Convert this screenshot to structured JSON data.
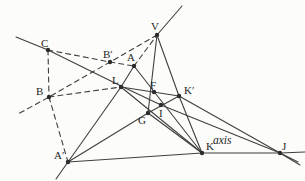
{
  "figure": {
    "type": "geometry-diagram",
    "canvas": {
      "width": 305,
      "height": 181
    },
    "colors": {
      "background": "#fcfcfa",
      "stroke": "#3f3f3f",
      "dot": "#2c2c2c",
      "label": "#262626"
    },
    "axis_label": {
      "text": "axis",
      "x": 213,
      "y": 144,
      "font_size": 11.5
    },
    "points": [
      {
        "id": "V",
        "label": "V",
        "x": 157,
        "y": 35,
        "lx": 151,
        "ly": 30
      },
      {
        "id": "C",
        "label": "C",
        "x": 48,
        "y": 50,
        "lx": 41,
        "ly": 47
      },
      {
        "id": "Bp",
        "label": "B′",
        "x": 110,
        "y": 62,
        "lx": 103,
        "ly": 58
      },
      {
        "id": "A",
        "label": "A",
        "x": 134,
        "y": 66,
        "lx": 127,
        "ly": 61
      },
      {
        "id": "L",
        "label": "L",
        "x": 121,
        "y": 87,
        "lx": 112,
        "ly": 84
      },
      {
        "id": "F",
        "label": "F",
        "x": 154,
        "y": 92,
        "lx": 150,
        "ly": 89
      },
      {
        "id": "Kp",
        "label": "K′",
        "x": 179,
        "y": 96,
        "lx": 184,
        "ly": 94
      },
      {
        "id": "B",
        "label": "B",
        "x": 49,
        "y": 97,
        "lx": 36,
        "ly": 95
      },
      {
        "id": "I",
        "label": "I",
        "x": 161,
        "y": 105,
        "lx": 159,
        "ly": 117
      },
      {
        "id": "G",
        "label": "G",
        "x": 148,
        "y": 113,
        "lx": 138,
        "ly": 124
      },
      {
        "id": "Ap",
        "label": "A′",
        "x": 68,
        "y": 162,
        "lx": 54,
        "ly": 159
      },
      {
        "id": "K",
        "label": "K",
        "x": 202,
        "y": 153,
        "lx": 206,
        "ly": 150
      },
      {
        "id": "J",
        "label": "J",
        "x": 280,
        "y": 153,
        "lx": 282,
        "ly": 150
      }
    ],
    "solid_lines": [
      {
        "name": "line-C-L-I-J",
        "points": [
          [
            16,
            37
          ],
          [
            48,
            50
          ],
          [
            121,
            86
          ],
          [
            161,
            105
          ],
          [
            280,
            153
          ],
          [
            298,
            162
          ]
        ]
      },
      {
        "name": "line-V-top-extension",
        "points": [
          [
            157,
            35
          ],
          [
            182,
            6
          ]
        ]
      },
      {
        "name": "line-A-L-Aprime",
        "points": [
          [
            134,
            66
          ],
          [
            121,
            87
          ],
          [
            68,
            162
          ],
          [
            56,
            179
          ]
        ]
      },
      {
        "name": "line-V-Kprime-K",
        "points": [
          [
            157,
            35
          ],
          [
            179,
            96
          ],
          [
            202,
            153
          ]
        ]
      },
      {
        "name": "line-V-F-G",
        "points": [
          [
            157,
            35
          ],
          [
            148,
            113
          ]
        ]
      },
      {
        "name": "line-L-Kprime",
        "points": [
          [
            121,
            87
          ],
          [
            179,
            96
          ]
        ]
      },
      {
        "name": "line-L-K",
        "points": [
          [
            121,
            87
          ],
          [
            202,
            153
          ]
        ]
      },
      {
        "name": "line-A-F-I-K",
        "points": [
          [
            134,
            66
          ],
          [
            202,
            153
          ]
        ]
      },
      {
        "name": "line-Aprime-G-Kprime",
        "points": [
          [
            68,
            162
          ],
          [
            148,
            113
          ],
          [
            179,
            96
          ]
        ]
      },
      {
        "name": "line-Kprime-J",
        "points": [
          [
            179,
            96
          ],
          [
            280,
            153
          ],
          [
            300,
            165
          ]
        ]
      },
      {
        "name": "line-axis",
        "points": [
          [
            68,
            162
          ],
          [
            202,
            153
          ],
          [
            280,
            153
          ],
          [
            305,
            152
          ]
        ]
      },
      {
        "name": "line-G-K",
        "points": [
          [
            148,
            113
          ],
          [
            202,
            153
          ]
        ]
      }
    ],
    "dashed_lines": [
      {
        "name": "dash-C-Bprime-A",
        "points": [
          [
            48,
            50
          ],
          [
            110,
            62
          ],
          [
            134,
            66
          ]
        ]
      },
      {
        "name": "dash-A-V",
        "points": [
          [
            134,
            66
          ],
          [
            157,
            35
          ]
        ]
      },
      {
        "name": "dash-V-Bprime-B-ext",
        "points": [
          [
            157,
            35
          ],
          [
            110,
            62
          ],
          [
            49,
            97
          ],
          [
            18,
            114
          ]
        ]
      },
      {
        "name": "dash-C-B",
        "points": [
          [
            48,
            50
          ],
          [
            49,
            97
          ]
        ]
      },
      {
        "name": "dash-B-Aprime",
        "points": [
          [
            49,
            97
          ],
          [
            68,
            162
          ]
        ]
      },
      {
        "name": "dash-B-L",
        "points": [
          [
            49,
            97
          ],
          [
            121,
            87
          ]
        ]
      }
    ],
    "style": {
      "line_width": 1.1,
      "dash_pattern": "5,4",
      "dot_radius": 2.2,
      "label_font_size": 11
    }
  }
}
